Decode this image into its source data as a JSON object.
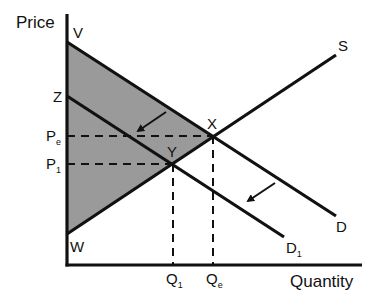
{
  "diagram": {
    "axes": {
      "y_label": "Price",
      "x_label": "Quantity"
    },
    "curves": [
      {
        "id": "D",
        "label": "D",
        "type": "demand",
        "from": "V",
        "description": "Original demand"
      },
      {
        "id": "D1",
        "label": "D",
        "label_sub": "1",
        "type": "demand",
        "from": "Z",
        "description": "Shifted demand (leftward)"
      },
      {
        "id": "S",
        "label": "S",
        "type": "supply",
        "from": "W"
      }
    ],
    "points": [
      {
        "label": "V",
        "description": "D intercept on price axis"
      },
      {
        "label": "Z",
        "description": "D1 intercept on price axis"
      },
      {
        "label": "W",
        "description": "S intercept on price axis"
      },
      {
        "label": "X",
        "description": "Equilibrium of D and S"
      },
      {
        "label": "Y",
        "description": "Equilibrium of D1 and S"
      }
    ],
    "price_levels": [
      {
        "label": "P",
        "sub": "e",
        "at_point": "X"
      },
      {
        "label": "P",
        "sub": "1",
        "at_point": "Y"
      }
    ],
    "quantity_levels": [
      {
        "label": "Q",
        "sub": "1",
        "at_point": "Y"
      },
      {
        "label": "Q",
        "sub": "e",
        "at_point": "X"
      }
    ],
    "shaded_region": {
      "vertices": [
        "V",
        "X",
        "W"
      ],
      "color": "#9a9a9a"
    },
    "arrows": [
      {
        "direction": "down-left",
        "meaning": "demand shift from D to D1"
      },
      {
        "direction": "down-left",
        "meaning": "demand shift from D to D1"
      }
    ],
    "colors": {
      "line": "#111111",
      "shade": "#9a9a9a",
      "background": "#ffffff"
    }
  },
  "labels": {
    "price": "Price",
    "quantity": "Quantity",
    "V": "V",
    "Z": "Z",
    "W": "W",
    "X": "X",
    "Y": "Y",
    "S": "S",
    "D": "D",
    "D1_main": "D",
    "D1_sub": "1",
    "Pe_main": "P",
    "Pe_sub": "e",
    "P1_main": "P",
    "P1_sub": "1",
    "Q1_main": "Q",
    "Q1_sub": "1",
    "Qe_main": "Q",
    "Qe_sub": "e"
  }
}
